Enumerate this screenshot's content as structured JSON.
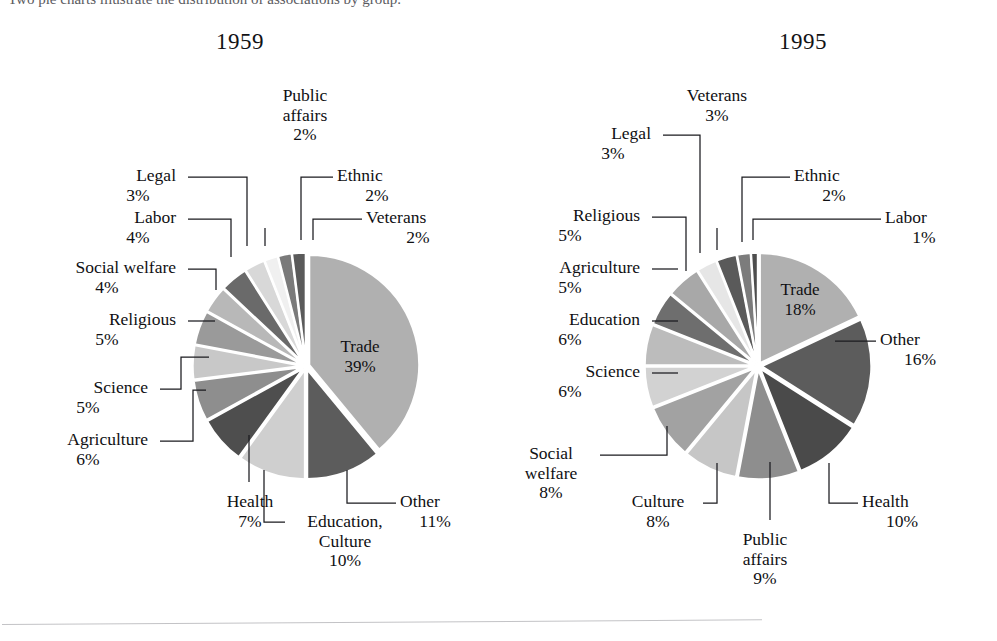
{
  "page": {
    "background": "#ffffff",
    "cropped_caption_fragment": "Two pie charts illustrate the distribution of associations by group."
  },
  "charts": [
    {
      "id": "chart-1959",
      "title": "1959",
      "title_pos": {
        "x": 216,
        "y": 29
      },
      "center": {
        "x": 306,
        "y": 366
      },
      "radius": 110,
      "explode": 3.4,
      "start_angle": -90,
      "chart_data": {
        "type": "pie",
        "title": "1959",
        "legend": "none",
        "units": "percent",
        "categories": [
          "Trade",
          "Other",
          "Education, Culture",
          "Health",
          "Agriculture",
          "Science",
          "Religious",
          "Social welfare",
          "Labor",
          "Legal",
          "Public affairs",
          "Ethnic",
          "Veterans"
        ],
        "values": [
          39,
          11,
          10,
          7,
          6,
          5,
          5,
          4,
          4,
          3,
          2,
          2,
          2
        ],
        "slices": [
          {
            "name": "Trade",
            "value": 39,
            "label": "Trade",
            "pct": "39%",
            "color": "#b0b0b0",
            "inside": true,
            "tx": 360,
            "ty": 352
          },
          {
            "name": "Other",
            "value": 11,
            "label": "Other",
            "pct": "11%",
            "color": "#5c5c5c",
            "inside": false
          },
          {
            "name": "Education, Culture",
            "value": 10,
            "label": "Education,\nCulture",
            "pct": "10%",
            "color": "#cfcfcf",
            "inside": false
          },
          {
            "name": "Health",
            "value": 7,
            "label": "Health",
            "pct": "7%",
            "color": "#4e4e4e",
            "inside": false
          },
          {
            "name": "Agriculture",
            "value": 6,
            "label": "Agriculture",
            "pct": "6%",
            "color": "#8e8e8e",
            "inside": false
          },
          {
            "name": "Science",
            "value": 5,
            "label": "Science",
            "pct": "5%",
            "color": "#c8c8c8",
            "inside": false
          },
          {
            "name": "Religious",
            "value": 5,
            "label": "Religious",
            "pct": "5%",
            "color": "#9a9a9a",
            "inside": false
          },
          {
            "name": "Social welfare",
            "value": 4,
            "label": "Social welfare",
            "pct": "4%",
            "color": "#b8b8b8",
            "inside": false
          },
          {
            "name": "Labor",
            "value": 4,
            "label": "Labor",
            "pct": "4%",
            "color": "#6a6a6a",
            "inside": false
          },
          {
            "name": "Legal",
            "value": 3,
            "label": "Legal",
            "pct": "3%",
            "color": "#d8d8d8",
            "inside": false
          },
          {
            "name": "Public affairs",
            "value": 2,
            "label": "Public\naffairs",
            "pct": "2%",
            "color": "#f0f0f0",
            "inside": false
          },
          {
            "name": "Ethnic",
            "value": 2,
            "label": "Ethnic",
            "pct": "2%",
            "color": "#7a7a7a",
            "inside": false
          },
          {
            "name": "Veterans",
            "value": 2,
            "label": "Veterans",
            "pct": "2%",
            "color": "#5a5a5a",
            "inside": false
          }
        ]
      },
      "callouts": [
        {
          "name": "public-affairs",
          "label": "Public\naffairs",
          "pct": "2%",
          "align": "c",
          "x": 270,
          "y": 86,
          "w": 70,
          "path": "M 265 228 L 265 246"
        },
        {
          "name": "legal",
          "label": "Legal",
          "pct": "3%",
          "align": "r",
          "x": 100,
          "y": 166,
          "w": 76,
          "path": "M 188 177 L 247 177 L 247 246"
        },
        {
          "name": "ethnic",
          "label": "Ethnic",
          "pct": "2%",
          "align": "l",
          "x": 337,
          "y": 166,
          "w": 80,
          "path": "M 333 177 L 301 177 L 301 240"
        },
        {
          "name": "labor",
          "label": "Labor",
          "pct": "4%",
          "align": "r",
          "x": 100,
          "y": 208,
          "w": 76,
          "path": "M 188 219 L 231 219 L 231 257"
        },
        {
          "name": "veterans",
          "label": "Veterans",
          "pct": "2%",
          "align": "l",
          "x": 366,
          "y": 208,
          "w": 104,
          "path": "M 362 219 L 313 219 L 313 240"
        },
        {
          "name": "social-welfare",
          "label": "Social welfare",
          "pct": "4%",
          "align": "r",
          "x": 38,
          "y": 258,
          "w": 138,
          "path": "M 188 269 L 216 269 L 216 290"
        },
        {
          "name": "religious",
          "label": "Religious",
          "pct": "5%",
          "align": "r",
          "x": 38,
          "y": 310,
          "w": 138,
          "path": "M 188 321 L 215 321"
        },
        {
          "name": "science",
          "label": "Science",
          "pct": "5%",
          "align": "r",
          "x": 28,
          "y": 378,
          "w": 120,
          "path": "M 160 389 L 181 389 L 181 357 L 209 357"
        },
        {
          "name": "agriculture",
          "label": "Agriculture",
          "pct": "6%",
          "align": "r",
          "x": 28,
          "y": 430,
          "w": 120,
          "path": "M 160 441 L 193 441 L 193 390 L 206 390"
        },
        {
          "name": "health",
          "label": "Health",
          "pct": "7%",
          "align": "c",
          "x": 215,
          "y": 492,
          "w": 70,
          "path": "M 249 482 L 249 435"
        },
        {
          "name": "education",
          "label": "Education,\nCulture",
          "pct": "10%",
          "align": "c",
          "x": 290,
          "y": 512,
          "w": 110,
          "path": "M 285 522 L 264 522 L 264 470"
        },
        {
          "name": "other",
          "label": "Other",
          "pct": "11%",
          "align": "l",
          "x": 400,
          "y": 492,
          "w": 70,
          "path": "M 396 503 L 347 503 L 347 470"
        }
      ]
    },
    {
      "id": "chart-1995",
      "title": "1995",
      "title_pos": {
        "x": 779,
        "y": 29
      },
      "center": {
        "x": 758,
        "y": 366
      },
      "radius": 110,
      "explode": 3.4,
      "start_angle": -90,
      "chart_data": {
        "type": "pie",
        "title": "1995",
        "legend": "none",
        "units": "percent",
        "categories": [
          "Trade",
          "Other",
          "Health",
          "Public affairs",
          "Culture",
          "Social welfare",
          "Science",
          "Education",
          "Agriculture",
          "Religious",
          "Veterans",
          "Legal",
          "Ethnic",
          "Labor"
        ],
        "values": [
          18,
          16,
          10,
          9,
          8,
          8,
          6,
          6,
          5,
          5,
          3,
          3,
          2,
          1
        ],
        "slices": [
          {
            "name": "Trade",
            "value": 18,
            "label": "Trade",
            "pct": "18%",
            "color": "#b0b0b0",
            "inside": true,
            "tx": 800,
            "ty": 295
          },
          {
            "name": "Other",
            "value": 16,
            "label": "Other",
            "pct": "16%",
            "color": "#5c5c5c",
            "inside": false
          },
          {
            "name": "Health",
            "value": 10,
            "label": "Health",
            "pct": "10%",
            "color": "#4a4a4a",
            "inside": false
          },
          {
            "name": "Public affairs",
            "value": 9,
            "label": "Public\naffairs",
            "pct": "9%",
            "color": "#8e8e8e",
            "inside": false
          },
          {
            "name": "Culture",
            "value": 8,
            "label": "Culture",
            "pct": "8%",
            "color": "#c6c6c6",
            "inside": false
          },
          {
            "name": "Social welfare",
            "value": 8,
            "label": "Social\nwelfare",
            "pct": "8%",
            "color": "#a2a2a2",
            "inside": false
          },
          {
            "name": "Science",
            "value": 6,
            "label": "Science",
            "pct": "6%",
            "color": "#d2d2d2",
            "inside": false
          },
          {
            "name": "Education",
            "value": 6,
            "label": "Education",
            "pct": "6%",
            "color": "#bcbcbc",
            "inside": false
          },
          {
            "name": "Agriculture",
            "value": 5,
            "label": "Agriculture",
            "pct": "5%",
            "color": "#6e6e6e",
            "inside": false
          },
          {
            "name": "Religious",
            "value": 5,
            "label": "Religious",
            "pct": "5%",
            "color": "#a8a8a8",
            "inside": false
          },
          {
            "name": "Veterans",
            "value": 3,
            "label": "Veterans",
            "pct": "3%",
            "color": "#e6e6e6",
            "inside": false
          },
          {
            "name": "Legal",
            "value": 3,
            "label": "Legal",
            "pct": "3%",
            "color": "#5a5a5a",
            "inside": false
          },
          {
            "name": "Ethnic",
            "value": 2,
            "label": "Ethnic",
            "pct": "2%",
            "color": "#7c7c7c",
            "inside": false
          },
          {
            "name": "Labor",
            "value": 1,
            "label": "Labor",
            "pct": "1%",
            "color": "#4e4e4e",
            "inside": false
          }
        ]
      },
      "callouts": [
        {
          "name": "veterans",
          "label": "Veterans",
          "pct": "3%",
          "align": "c",
          "x": 672,
          "y": 86,
          "w": 90,
          "path": "M 717 228 L 717 250"
        },
        {
          "name": "legal",
          "label": "Legal",
          "pct": "3%",
          "align": "r",
          "x": 575,
          "y": 124,
          "w": 76,
          "path": "M 663 135 L 700 135 L 700 253"
        },
        {
          "name": "ethnic",
          "label": "Ethnic",
          "pct": "2%",
          "align": "l",
          "x": 794,
          "y": 166,
          "w": 80,
          "path": "M 790 177 L 742 177 L 742 242"
        },
        {
          "name": "religious",
          "label": "Religious",
          "pct": "5%",
          "align": "r",
          "x": 500,
          "y": 206,
          "w": 140,
          "path": "M 652 217 L 686 217 L 686 271"
        },
        {
          "name": "labor",
          "label": "Labor",
          "pct": "1%",
          "align": "l",
          "x": 885,
          "y": 208,
          "w": 78,
          "path": "M 881 219 L 753 219 L 753 240"
        },
        {
          "name": "agriculture",
          "label": "Agriculture",
          "pct": "5%",
          "align": "r",
          "x": 500,
          "y": 258,
          "w": 140,
          "path": "M 652 269 L 678 269"
        },
        {
          "name": "education",
          "label": "Education",
          "pct": "6%",
          "align": "r",
          "x": 500,
          "y": 310,
          "w": 140,
          "path": "M 652 321 L 678 321"
        },
        {
          "name": "science",
          "label": "Science",
          "pct": "6%",
          "align": "r",
          "x": 500,
          "y": 362,
          "w": 140,
          "path": "M 652 373 L 678 373"
        },
        {
          "name": "other",
          "label": "Other",
          "pct": "16%",
          "align": "l",
          "x": 880,
          "y": 330,
          "w": 80,
          "path": "M 876 341 L 835 341"
        },
        {
          "name": "social-welfare",
          "label": "Social\nwelfare",
          "pct": "8%",
          "align": "c",
          "x": 505,
          "y": 444,
          "w": 92,
          "path": "M 600 455 L 667 455 L 667 426"
        },
        {
          "name": "culture",
          "label": "Culture",
          "pct": "8%",
          "align": "c",
          "x": 613,
          "y": 492,
          "w": 90,
          "path": "M 703 503 L 717 503 L 717 463"
        },
        {
          "name": "health",
          "label": "Health",
          "pct": "10%",
          "align": "l",
          "x": 862,
          "y": 492,
          "w": 80,
          "path": "M 858 503 L 829 503 L 829 463"
        },
        {
          "name": "public-affairs",
          "label": "Public\naffairs",
          "pct": "9%",
          "align": "c",
          "x": 725,
          "y": 530,
          "w": 80,
          "path": "M 770 520 L 770 462"
        }
      ]
    }
  ]
}
